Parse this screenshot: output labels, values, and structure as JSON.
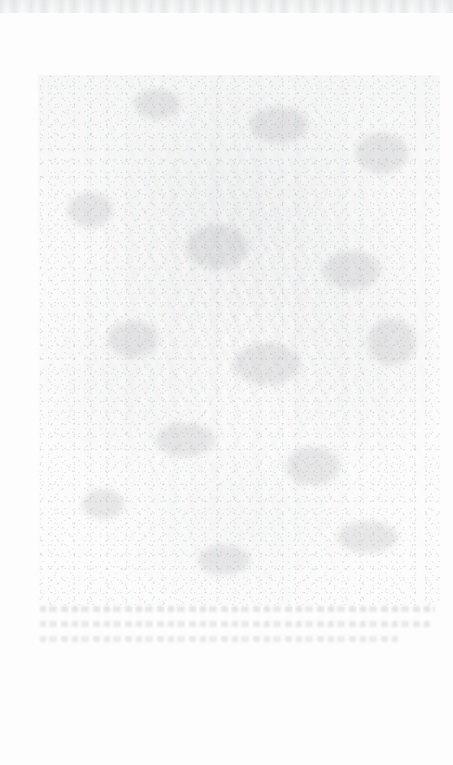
{
  "document": {
    "kind": "scanned-page",
    "condition": "severely faded / bleached; contents illegible",
    "background_color": "#fdfdfd",
    "ink_color": "#94989d",
    "page_width": 453,
    "page_height": 765
  },
  "scan_edge": {
    "label": "",
    "color": "#eceef0"
  },
  "plate": {
    "label": "",
    "alt": "faded photographic plate, vertical drapery-like forms, no legible detail",
    "left": 38,
    "top": 75,
    "width": 402,
    "height": 530,
    "tone": "#a8acb0"
  },
  "caption": {
    "lines": [
      {
        "text": "",
        "legible": false
      },
      {
        "text": "",
        "legible": false
      },
      {
        "text": "",
        "legible": false
      }
    ]
  },
  "margins": {
    "bottom_note": ""
  }
}
